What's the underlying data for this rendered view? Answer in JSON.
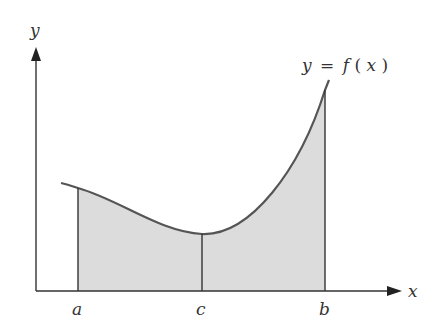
{
  "figure": {
    "type": "area-under-curve",
    "axis_labels": {
      "x": "x",
      "y": "y"
    },
    "curve_label": "y = f(x)",
    "curve_label_parts": {
      "lhs": "y",
      "eq": "=",
      "f": "f",
      "open": "(",
      "arg": "x",
      "close": ")"
    },
    "points": [
      {
        "name": "a",
        "label": "a"
      },
      {
        "name": "c",
        "label": "c"
      },
      {
        "name": "b",
        "label": "b"
      }
    ],
    "colors": {
      "curve": "#555555",
      "axis": "#333333",
      "fill": "#dcdcdc",
      "verticals": "#333333"
    }
  }
}
